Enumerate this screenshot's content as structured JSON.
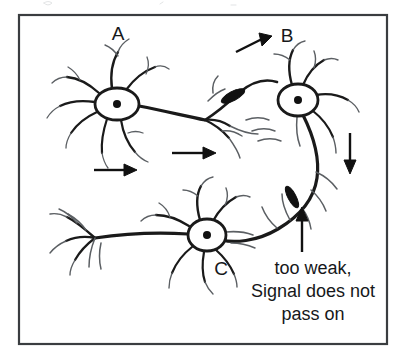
{
  "figure": {
    "frame": {
      "border_color": "#3a3d40",
      "background_color": "#ffffff",
      "x": 18,
      "y": 14,
      "width": 370,
      "height": 331
    },
    "ink_color": "#1a1a1a",
    "light_ink_color": "#5b5f63"
  },
  "neurons": [
    {
      "id": "A",
      "label": "A",
      "label_x": 118,
      "label_y": 40,
      "soma_cx": 117,
      "soma_cy": 104,
      "soma_rx": 22,
      "soma_ry": 16,
      "nucleus_r": 4
    },
    {
      "id": "B",
      "label": "B",
      "label_x": 287,
      "label_y": 42,
      "soma_cx": 298,
      "soma_cy": 100,
      "soma_rx": 20,
      "soma_ry": 16,
      "nucleus_r": 4
    },
    {
      "id": "C",
      "label": "C",
      "label_x": 221,
      "label_y": 275,
      "soma_cx": 207,
      "soma_cy": 235,
      "soma_rx": 19,
      "soma_ry": 16,
      "nucleus_r": 4
    }
  ],
  "synapses": [
    {
      "name": "synapse-a-to-b",
      "cx": 233,
      "cy": 96,
      "angle_deg": -28,
      "length": 26,
      "thickness": 9
    },
    {
      "name": "synapse-b-to-c",
      "cx": 292,
      "cy": 197,
      "angle_deg": 62,
      "length": 24,
      "thickness": 8
    }
  ],
  "arrows": [
    {
      "name": "flow-arrow-lower-left",
      "x1": 94,
      "y1": 170,
      "x2": 133,
      "y2": 170,
      "direction": "right"
    },
    {
      "name": "flow-arrow-mid",
      "x1": 172,
      "y1": 153,
      "x2": 214,
      "y2": 153,
      "direction": "right"
    },
    {
      "name": "flow-arrow-to-b",
      "x1": 236,
      "y1": 52,
      "x2": 269,
      "y2": 36,
      "direction": "up-right"
    },
    {
      "name": "flow-arrow-down-right",
      "x1": 350,
      "y1": 133,
      "x2": 350,
      "y2": 171,
      "direction": "down"
    },
    {
      "name": "pointer-arrow-to-weak-synapse",
      "x1": 302,
      "y1": 252,
      "x2": 302,
      "y2": 209,
      "direction": "up"
    }
  ],
  "annotation": {
    "name": "weak-signal-note",
    "lines": [
      "too weak,",
      "Signal does not",
      "pass on"
    ],
    "line_positions": [
      {
        "x": 313,
        "y": 274,
        "anchor": "middle"
      },
      {
        "x": 313,
        "y": 297,
        "anchor": "middle"
      },
      {
        "x": 313,
        "y": 320,
        "anchor": "middle"
      }
    ]
  }
}
